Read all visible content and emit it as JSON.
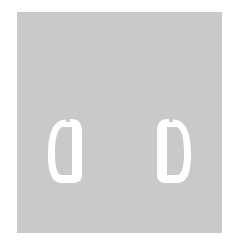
{
  "image": {
    "description": "Gray square with two white D-shaped rings, mirror images of each other",
    "background_color": "#ffffff",
    "panel_color": "#c9c9c9",
    "shape_color": "#ffffff"
  },
  "shapes": [
    {
      "name": "left-ring",
      "orientation": "mirrored-d"
    },
    {
      "name": "right-ring",
      "orientation": "d"
    }
  ]
}
